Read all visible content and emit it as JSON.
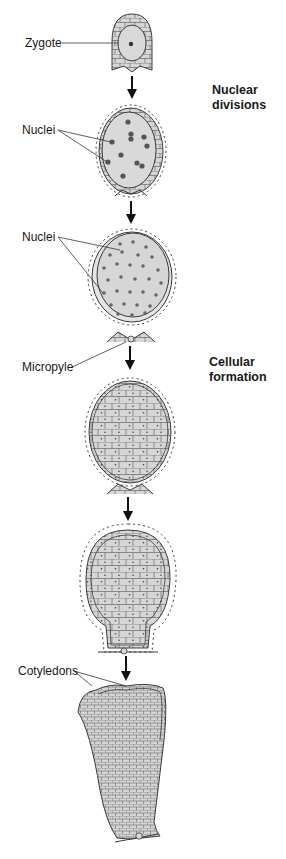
{
  "diagram": {
    "type": "embryo-development-sequence",
    "stages": [
      {
        "id": "zygote",
        "description": "Zygote in ovule"
      },
      {
        "id": "free-nuclear-few",
        "description": "Few free nuclei"
      },
      {
        "id": "free-nuclear-many",
        "description": "Many free nuclei"
      },
      {
        "id": "cellular-early",
        "description": "Cellular formation"
      },
      {
        "id": "cellular-late",
        "description": "Cellular embryo, elongating"
      },
      {
        "id": "cotyledon",
        "description": "Embryo with cotyledons"
      }
    ]
  },
  "labels": {
    "zygote": "Zygote",
    "nuclei_1": "Nuclei",
    "nuclei_2": "Nuclei",
    "micropyle": "Micropyle",
    "cotyledons": "Cotyledons"
  },
  "phases": {
    "nuclear": "Nuclear\ndivisions",
    "cellular": "Cellular\nformation"
  },
  "colors": {
    "fill": "#d9d9d9",
    "stroke": "#3a3a3a",
    "nucleus": "#555555",
    "arrow": "#111111"
  }
}
